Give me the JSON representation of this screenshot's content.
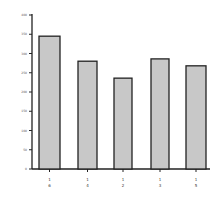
{
  "chart_data": {
    "type": "bar",
    "title": "",
    "xlabel": "",
    "ylabel": "",
    "categories": [
      "1 6",
      "1 4",
      "1 2",
      "1 3",
      "1 5"
    ],
    "values": [
      345,
      280,
      236,
      286,
      268
    ],
    "ylim": [
      0,
      400
    ],
    "yticks": [
      0,
      50,
      100,
      150,
      200,
      250,
      300,
      350,
      400
    ],
    "grid": false,
    "legend": null,
    "bar_color": "#c8c8c8",
    "edge_color": "#222222"
  }
}
